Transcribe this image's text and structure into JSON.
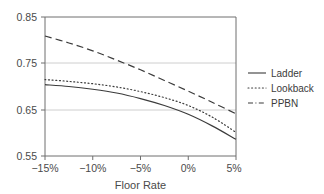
{
  "chart_data": {
    "type": "line",
    "title": "",
    "xlabel": "Floor Rate",
    "ylabel": "",
    "x": [
      -15,
      -12.5,
      -10,
      -7.5,
      -5,
      -2.5,
      0,
      2.5,
      5
    ],
    "x_tick_labels": [
      "−15%",
      "−10%",
      "−5%",
      "0%",
      "5%"
    ],
    "x_tick_values": [
      -15,
      -10,
      -5,
      0,
      5
    ],
    "y_tick_labels": [
      "0.85",
      "0.75",
      "0.65",
      "0.55"
    ],
    "y_tick_values": [
      0.85,
      0.75,
      0.65,
      0.55
    ],
    "xlim": [
      -15,
      5
    ],
    "ylim": [
      0.55,
      0.85
    ],
    "grid": "horizontal-at-0.75-and-0.65",
    "legend_position": "right",
    "series": [
      {
        "name": "Ladder",
        "style": "solid",
        "color": "#3b3b3b",
        "values": [
          0.704,
          0.7,
          0.694,
          0.686,
          0.674,
          0.659,
          0.64,
          0.615,
          0.586
        ]
      },
      {
        "name": "Lookback",
        "style": "dotted",
        "color": "#3b3b3b",
        "values": [
          0.715,
          0.711,
          0.706,
          0.699,
          0.689,
          0.676,
          0.659,
          0.634,
          0.601
        ]
      },
      {
        "name": "PPBN",
        "style": "dashed",
        "color": "#3b3b3b",
        "values": [
          0.809,
          0.794,
          0.777,
          0.757,
          0.736,
          0.713,
          0.69,
          0.666,
          0.641
        ]
      }
    ]
  },
  "legend": {
    "items": [
      {
        "label": "Ladder",
        "style": "solid"
      },
      {
        "label": "Lookback",
        "style": "dotted"
      },
      {
        "label": "PPBN",
        "style": "dashdot"
      }
    ]
  },
  "axes": {
    "x_title": "Floor Rate",
    "x_ticks": [
      "−15%",
      "−10%",
      "−5%",
      "0%",
      "5%"
    ],
    "y_ticks": [
      "0.85",
      "0.75",
      "0.65",
      "0.55"
    ]
  },
  "colors": {
    "line": "#3b3b3b",
    "axis": "#6e6e6e",
    "grid": "#c8c8c8",
    "text": "#4a4a4a",
    "background": "#ffffff"
  }
}
